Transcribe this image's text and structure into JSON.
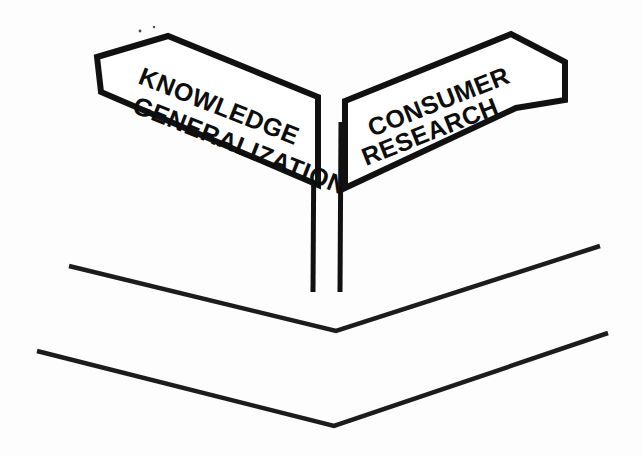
{
  "scene": {
    "title": "Two-way directional signpost illustration",
    "background_color": "#fdfdfd",
    "ink_color": "#111111",
    "width": 643,
    "height": 456
  },
  "signs": [
    {
      "id": "left-sign",
      "direction": "left",
      "tilt_degrees": 22,
      "line1": "KNOWLEDGE",
      "line2": "GENERALIZATION",
      "arrow_tip": {
        "x": 97,
        "y": 57
      },
      "fill_color": "#ffffff",
      "outline_color": "#111111"
    },
    {
      "id": "right-sign",
      "direction": "right",
      "tilt_degrees": -22,
      "line1": "CONSUMER",
      "line2": "RESEARCH",
      "arrow_tip": {
        "x": 565,
        "y": 62
      },
      "fill_color": "#ffffff",
      "outline_color": "#111111"
    }
  ],
  "post": {
    "id": "signpost",
    "left_edge_x": 313,
    "right_edge_x": 340,
    "top_y": 120,
    "bottom_y": 292,
    "color": "#111111"
  },
  "chevrons": [
    {
      "id": "upper-chevron",
      "left_start": {
        "x": 69,
        "y": 266
      },
      "vertex": {
        "x": 336,
        "y": 331
      },
      "right_end": {
        "x": 600,
        "y": 246
      },
      "color": "#1c1c1c"
    },
    {
      "id": "lower-chevron",
      "left_start": {
        "x": 37,
        "y": 351
      },
      "vertex": {
        "x": 334,
        "y": 426
      },
      "right_end": {
        "x": 608,
        "y": 333
      },
      "color": "#1c1c1c"
    }
  ]
}
